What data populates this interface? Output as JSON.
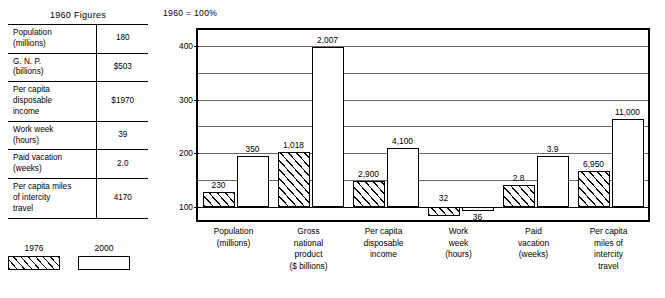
{
  "table": {
    "title": "1960 Figures",
    "rows": [
      {
        "label": "Population\n(millions)",
        "value": "180"
      },
      {
        "label": "G. N. P.\n(billions)",
        "value": "$503"
      },
      {
        "label": "Per capita\ndisposable\nincome",
        "value": "$1970"
      },
      {
        "label": "Work week\n(hours)",
        "value": "39"
      },
      {
        "label": "Paid vacation\n(weeks)",
        "value": "2.0"
      },
      {
        "label": "Per capita miles\nof intercity\ntravel",
        "value": "4170"
      }
    ]
  },
  "legend": {
    "position": "bottom-left",
    "items": [
      {
        "label": "1976",
        "swatch": "hatched"
      },
      {
        "label": "2000",
        "swatch": "solid"
      }
    ]
  },
  "chart_data": {
    "type": "bar",
    "title": "1960 = 100%",
    "xlabel": "",
    "ylabel": "",
    "ylim": [
      75,
      430
    ],
    "baseline": 100,
    "grid": true,
    "gridlines": [
      100,
      150,
      200,
      250,
      300,
      350,
      400
    ],
    "yticks": [
      "100",
      "200",
      "300",
      "400"
    ],
    "ytick_values": [
      100,
      200,
      300,
      400
    ],
    "categories": [
      "Population\n(millions)",
      "Gross\nnational\nproduct\n($ billions)",
      "Per capita\ndisposable\nincome",
      "Work\nweek\n(hours)",
      "Paid\nvacation\n(weeks)",
      "Per capita\nmiles of\nintercity\ntravel"
    ],
    "series": [
      {
        "name": "1976",
        "swatch": "hatched",
        "values": [
          128,
          202,
          147,
          82,
          140,
          167
        ],
        "labels": [
          "230",
          "1,018",
          "2,900",
          "32",
          "2.8",
          "6,950"
        ]
      },
      {
        "name": "2000",
        "swatch": "solid",
        "values": [
          194,
          399,
          209,
          92,
          195,
          264
        ],
        "labels": [
          "350",
          "2,007",
          "4,100",
          "36",
          "3.9",
          "11,000"
        ]
      }
    ]
  }
}
